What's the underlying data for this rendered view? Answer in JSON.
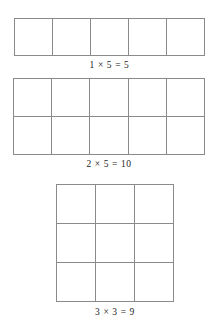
{
  "page": {
    "background_color": "#ffffff",
    "line_color": "#8a8a8a",
    "text_color": "#1c1c1c"
  },
  "figures": [
    {
      "id": "fig-1",
      "rows": 1,
      "cols": 5,
      "cell_count": 5,
      "caption": "1 × 5 = 5",
      "factors": [
        1,
        5
      ],
      "product": 5
    },
    {
      "id": "fig-2",
      "rows": 2,
      "cols": 5,
      "cell_count": 10,
      "caption": "2 × 5 = 10",
      "factors": [
        2,
        5
      ],
      "product": 10
    },
    {
      "id": "fig-3",
      "rows": 3,
      "cols": 3,
      "cell_count": 9,
      "caption": "3 × 3 = 9",
      "factors": [
        3,
        3
      ],
      "product": 9
    }
  ]
}
